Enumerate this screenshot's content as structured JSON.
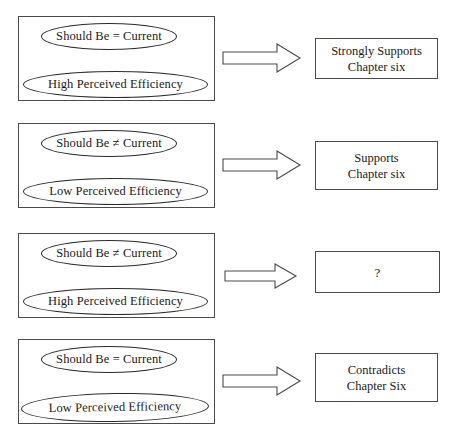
{
  "diagram": {
    "style": {
      "box_border_color": "#4a4a4a",
      "ellipse_border_color": "#2b2b2b",
      "arrow_stroke_color": "#4a4a4a",
      "background_color": "#ffffff",
      "text_color": "#1a1a1a"
    },
    "arrow_icon_name": "right-arrow-icon",
    "rows": [
      {
        "id": "row-1",
        "condition": {
          "top_ellipse": "Should Be = Current",
          "bottom_ellipse": "High Perceived Efficiency"
        },
        "arrow": "→",
        "outcome": {
          "lines": [
            "Strongly Supports",
            "Chapter six"
          ]
        }
      },
      {
        "id": "row-2",
        "condition": {
          "top_ellipse": "Should Be ≠ Current",
          "bottom_ellipse": "Low Perceived Efficiency"
        },
        "arrow": "→",
        "outcome": {
          "lines": [
            "Supports",
            "Chapter six"
          ]
        }
      },
      {
        "id": "row-3",
        "condition": {
          "top_ellipse": "Should Be ≠ Current",
          "bottom_ellipse": "High Perceived Efficiency"
        },
        "arrow": "→",
        "outcome": {
          "lines": [
            "?"
          ]
        }
      },
      {
        "id": "row-4",
        "condition": {
          "top_ellipse": "Should Be = Current",
          "bottom_ellipse": "Low Perceived Efficiency"
        },
        "arrow": "→",
        "outcome": {
          "lines": [
            "Contradicts",
            "Chapter Six"
          ]
        }
      }
    ]
  }
}
